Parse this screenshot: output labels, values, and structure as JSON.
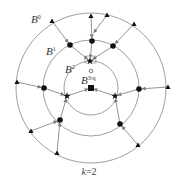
{
  "diagram": {
    "caption": {
      "var": "k",
      "eq": "=2"
    },
    "center": [
      91,
      88
    ],
    "rings": [
      {
        "name": "B",
        "sup": "0",
        "r": 75,
        "label_pos": [
          31,
          20
        ]
      },
      {
        "name": "B",
        "sup": "1",
        "r": 48,
        "label_pos": [
          46,
          51
        ]
      },
      {
        "name": "B",
        "sup": "2",
        "r": 27,
        "label_pos": [
          65,
          67
        ]
      },
      {
        "name": "B",
        "sup": "3/q",
        "r": 0,
        "label_pos": [
          81,
          77
        ]
      }
    ],
    "nodes": {
      "triangles": [
        [
          52,
          21
        ],
        [
          91,
          16
        ],
        [
          107,
          15
        ],
        [
          134,
          24
        ],
        [
          17,
          82
        ],
        [
          168,
          87
        ],
        [
          31,
          131
        ],
        [
          57,
          153
        ],
        [
          138,
          145
        ]
      ],
      "circles": [
        [
          70,
          45
        ],
        [
          92,
          41
        ],
        [
          113,
          46
        ],
        [
          44,
          88
        ],
        [
          139,
          89
        ],
        [
          60,
          120
        ],
        [
          120,
          124
        ]
      ],
      "stars": [
        [
          90,
          61
        ],
        [
          67,
          96
        ],
        [
          115,
          96
        ]
      ],
      "square": [
        91,
        88
      ],
      "open_circle": [
        91,
        71
      ]
    },
    "edges": [
      [
        [
          52,
          21
        ],
        [
          70,
          45
        ]
      ],
      [
        [
          91,
          16
        ],
        [
          92,
          41
        ]
      ],
      [
        [
          107,
          15
        ],
        [
          92,
          35
        ]
      ],
      [
        [
          134,
          24
        ],
        [
          113,
          46
        ]
      ],
      [
        [
          17,
          82
        ],
        [
          44,
          88
        ]
      ],
      [
        [
          168,
          87
        ],
        [
          139,
          89
        ]
      ],
      [
        [
          31,
          131
        ],
        [
          60,
          120
        ]
      ],
      [
        [
          57,
          153
        ],
        [
          60,
          120
        ]
      ],
      [
        [
          138,
          145
        ],
        [
          120,
          124
        ]
      ],
      [
        [
          70,
          45
        ],
        [
          90,
          61
        ]
      ],
      [
        [
          92,
          41
        ],
        [
          90,
          61
        ]
      ],
      [
        [
          113,
          46
        ],
        [
          90,
          61
        ]
      ],
      [
        [
          44,
          88
        ],
        [
          67,
          96
        ]
      ],
      [
        [
          60,
          120
        ],
        [
          67,
          96
        ]
      ],
      [
        [
          139,
          89
        ],
        [
          115,
          96
        ]
      ],
      [
        [
          120,
          124
        ],
        [
          115,
          96
        ]
      ],
      [
        [
          67,
          96
        ],
        [
          91,
          88
        ]
      ],
      [
        [
          115,
          96
        ],
        [
          91,
          88
        ]
      ]
    ],
    "colors": {
      "line": "#777777",
      "node": "#111111",
      "ring": "#888888"
    }
  }
}
